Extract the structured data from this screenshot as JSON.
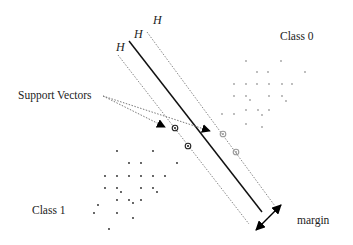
{
  "diagram": {
    "type": "svm-margin-illustration",
    "hyperplane_labels": [
      "H",
      "H",
      "H"
    ],
    "labels": {
      "class0": "Class 0",
      "class1": "Class 1",
      "support_vectors": "Support Vectors",
      "margin": "margin"
    },
    "colors": {
      "class0_points": "#a0a0a0",
      "class1_points": "#222222",
      "hyperplane": "#111111",
      "margin_lines": "#888888",
      "pointer": "#777777",
      "arrow": "#000000"
    },
    "class0_points": [
      [
        246,
        61
      ],
      [
        281,
        61
      ],
      [
        257,
        72
      ],
      [
        268,
        72
      ],
      [
        305,
        72
      ],
      [
        234,
        84
      ],
      [
        246,
        84
      ],
      [
        257,
        84
      ],
      [
        269,
        84
      ],
      [
        282,
        84
      ],
      [
        292,
        84
      ],
      [
        234,
        96
      ],
      [
        246,
        96
      ],
      [
        250,
        100
      ],
      [
        269,
        96
      ],
      [
        282,
        96
      ],
      [
        286,
        101
      ],
      [
        222,
        114
      ],
      [
        234,
        114
      ],
      [
        246,
        110
      ],
      [
        258,
        110
      ],
      [
        262,
        115
      ],
      [
        269,
        110
      ],
      [
        246,
        124
      ],
      [
        262,
        127
      ]
    ],
    "class1_points": [
      [
        117,
        151
      ],
      [
        153,
        151
      ],
      [
        129,
        163
      ],
      [
        141,
        163
      ],
      [
        177,
        163
      ],
      [
        105,
        176
      ],
      [
        117,
        176
      ],
      [
        129,
        176
      ],
      [
        141,
        176
      ],
      [
        153,
        176
      ],
      [
        165,
        176
      ],
      [
        105,
        188
      ],
      [
        117,
        188
      ],
      [
        121,
        192
      ],
      [
        141,
        188
      ],
      [
        153,
        188
      ],
      [
        157,
        192
      ],
      [
        98,
        205
      ],
      [
        117,
        200
      ],
      [
        129,
        200
      ],
      [
        133,
        203
      ],
      [
        141,
        200
      ],
      [
        94,
        213
      ],
      [
        117,
        213
      ],
      [
        133,
        218
      ],
      [
        109,
        229
      ]
    ],
    "support_vectors": {
      "class1": [
        [
          175,
          128
        ],
        [
          188,
          146
        ]
      ],
      "class0": [
        [
          223,
          134
        ],
        [
          236,
          152
        ]
      ]
    }
  }
}
